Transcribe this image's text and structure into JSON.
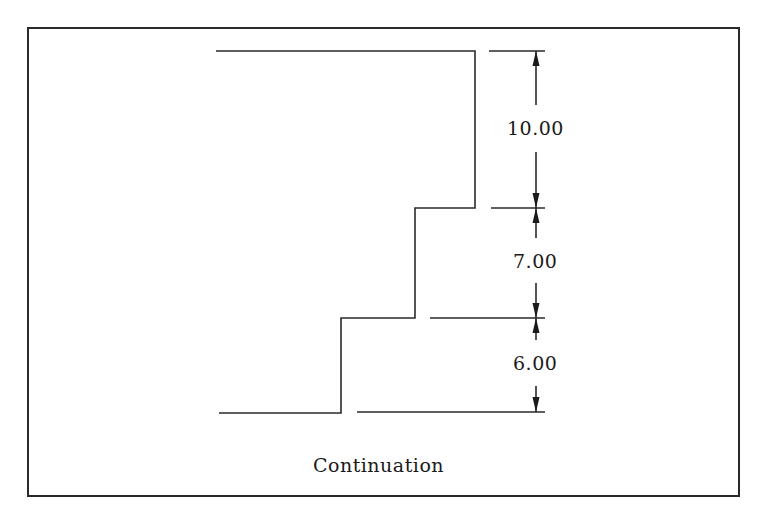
{
  "figure": {
    "caption": "Continuation",
    "dimensions": [
      {
        "label": "10.00",
        "from": "top",
        "to": "step-1"
      },
      {
        "label": "7.00",
        "from": "step-1",
        "to": "step-2"
      },
      {
        "label": "6.00",
        "from": "step-2",
        "to": "bottom"
      }
    ],
    "dimension_style": "continuation (chained) dimensioning",
    "colors": {
      "line": "#2a2a2a",
      "background": "#ffffff"
    }
  }
}
